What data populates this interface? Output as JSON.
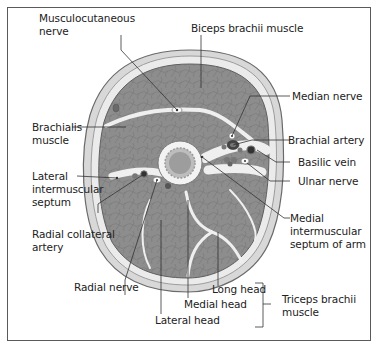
{
  "diagram": {
    "colors": {
      "muscle": "#8d8d8d",
      "muscle_dark": "#6f6f6f",
      "skin": "#e6e6e6",
      "fat": "#cfcfcf",
      "septum": "#f2f2f2",
      "bone_cortex": "#f4f4f4",
      "marrow": "#9a9a9a",
      "leader": "#333333",
      "frame": "#5a5a5a"
    },
    "labels": {
      "musculocutaneous_nerve": "Musculocutaneous\nnerve",
      "biceps_brachii": "Biceps brachii muscle",
      "median_nerve": "Median nerve",
      "brachialis": "Brachialis\nmuscle",
      "brachial_artery": "Brachial artery",
      "lateral_septum": "Lateral\nintermuscular\nseptum",
      "basilic_vein": "Basilic vein",
      "ulnar_nerve": "Ulnar nerve",
      "radial_collateral_artery": "Radial collateral\nartery",
      "medial_septum": "Medial\nintermuscular\nseptum of arm",
      "radial_nerve": "Radial nerve",
      "long_head": "Long head",
      "medial_head": "Medial head",
      "lateral_head": "Lateral head",
      "triceps_brachii": "Triceps brachii\nmuscle"
    }
  }
}
